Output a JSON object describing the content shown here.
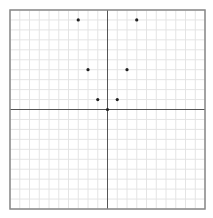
{
  "chart_data": {
    "type": "scatter",
    "title": "",
    "xlabel": "",
    "ylabel": "",
    "xlim": [
      -10,
      10
    ],
    "ylim": [
      -10,
      10
    ],
    "grid": true,
    "grid_step": 1,
    "legend": null,
    "series": [
      {
        "name": "points",
        "x": [
          -3,
          3,
          -2,
          2,
          -1,
          1,
          0
        ],
        "y": [
          9,
          9,
          4,
          4,
          1,
          1,
          0
        ]
      }
    ]
  },
  "colors": {
    "grid": "#e4e4e4",
    "axis": "#555555",
    "border": "#888888",
    "point": "#222222",
    "background": "#ffffff"
  },
  "layout": {
    "plot_left": 10,
    "plot_top": 10,
    "plot_right": 205,
    "plot_bottom": 209
  }
}
